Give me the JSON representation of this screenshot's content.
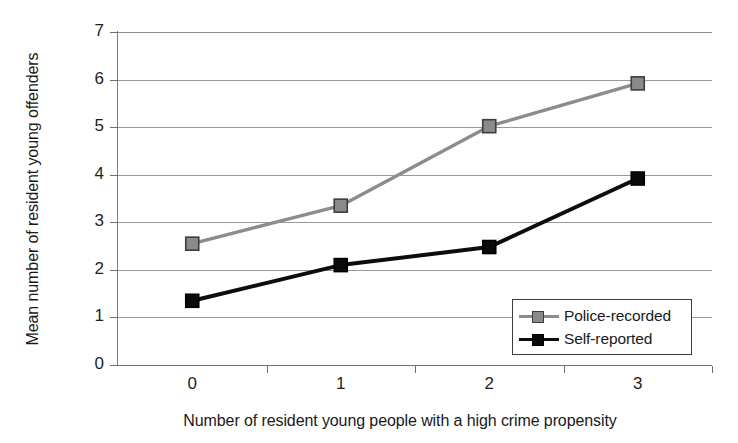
{
  "chart_data": {
    "type": "line",
    "title": "",
    "xlabel": "Number of resident young people with a high crime propensity",
    "ylabel": "Mean number of resident young offenders",
    "x": [
      0,
      1,
      2,
      3
    ],
    "categories": [
      "0",
      "1",
      "2",
      "3"
    ],
    "xtick_labels": [
      "0",
      "1",
      "2",
      "3"
    ],
    "ytick_labels": [
      "0",
      "1",
      "2",
      "3",
      "4",
      "5",
      "6",
      "7"
    ],
    "xlim": [
      -0.5,
      3.5
    ],
    "ylim": [
      0,
      7
    ],
    "grid": "horizontal",
    "legend_position": "lower right",
    "series": [
      {
        "name": "Police-recorded",
        "color": "#8c8c8c",
        "marker": "square",
        "marker_fill": "#8a8a8a",
        "marker_edge": "#3d3d3d",
        "values": [
          2.55,
          3.35,
          5.02,
          5.92
        ]
      },
      {
        "name": "Self-reported",
        "color": "#0d0d0d",
        "marker": "square",
        "marker_fill": "#0a0a0a",
        "marker_edge": "#000000",
        "values": [
          1.35,
          2.1,
          2.48,
          3.92
        ]
      }
    ]
  },
  "legend": {
    "entries": [
      {
        "label": "Police-recorded"
      },
      {
        "label": "Self-reported"
      }
    ]
  },
  "colors": {
    "police_recorded": "#8c8c8c",
    "self_reported": "#0d0d0d",
    "gridline": "#9a9a9a",
    "axis": "#6e6e6e",
    "background": "#ffffff"
  }
}
